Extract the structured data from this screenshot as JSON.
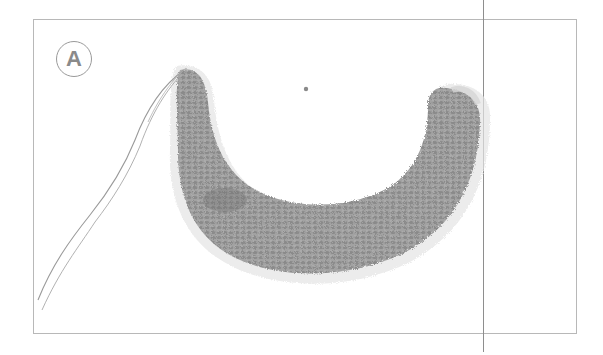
{
  "figure": {
    "label": "A",
    "colors": {
      "frame": "#b8b8b8",
      "guide_line": "#8e8e8e",
      "fabric": "#9c9c9c",
      "fabric_dark": "#7d7d7d",
      "label": "#8a8a8a"
    }
  }
}
